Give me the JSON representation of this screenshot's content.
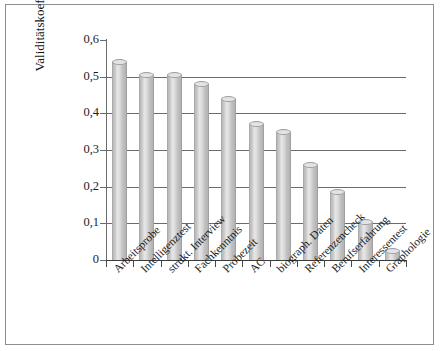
{
  "chart_data": {
    "type": "bar",
    "title": "",
    "xlabel": "",
    "ylabel": "Validitätskoeffizient",
    "ylim": [
      0,
      0.6
    ],
    "grid": true,
    "legend": "none",
    "decimal_separator": ",",
    "ytick_labels": [
      "0",
      "0,1",
      "0,2",
      "0,3",
      "0,4",
      "0,5",
      "0,6"
    ],
    "ytick_values": [
      0,
      0.1,
      0.2,
      0.3,
      0.4,
      0.5,
      0.6
    ],
    "categories": [
      "Arbeitsprobe",
      "Intelligenztest",
      "strukt. Interview",
      "Fachkenntnis",
      "Probezeit",
      "AC",
      "biograph. Daten",
      "Referenzencheck",
      "Berufserfahrung",
      "Interessentest",
      "Graphologie"
    ],
    "values": [
      0.54,
      0.505,
      0.505,
      0.48,
      0.44,
      0.37,
      0.35,
      0.26,
      0.185,
      0.105,
      0.025
    ]
  },
  "style": {
    "bar_fill": "#cfcfcf",
    "bar_edge": "#a0a0a0",
    "gridline_color": "#6b6b6b",
    "axis_color": "#3c3c3c",
    "frame_color": "#8d8d8d",
    "background": "#ffffff",
    "text_color": "#1a1a1a"
  }
}
